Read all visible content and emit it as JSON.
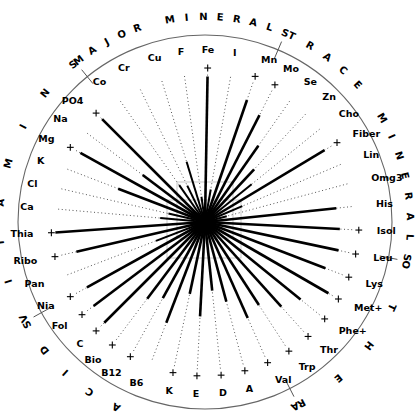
{
  "figure": {
    "center_x": 205,
    "center_y": 222,
    "outer_radius": 187,
    "axis_full_radius": 150
  },
  "groups": [
    {
      "name": "TRACE MINERALS",
      "text": "TRACE MINERALS",
      "start_deg": 295,
      "end_deg": 10
    },
    {
      "name": "OTHER",
      "text": "OTHER",
      "start_deg": 12,
      "end_deg": 62
    },
    {
      "name": "AMINO ACIDS",
      "text": "AMINO ACIDS",
      "start_deg": 64,
      "end_deg": 150
    },
    {
      "name": "VITAMINS",
      "text": "VITAMINS",
      "start_deg": 152,
      "end_deg": 230
    },
    {
      "name": "MAJOR MINERALS",
      "text": "MAJOR MINERALS",
      "start_deg": 232,
      "end_deg": 293
    }
  ],
  "chart_data": {
    "type": "radar",
    "xlabel": "",
    "ylabel": "",
    "grid": false,
    "legend_position": "none",
    "value_range": [
      0,
      1
    ],
    "sector_labels": [
      "TRACE MINERALS",
      "OTHER",
      "AMINO ACIDS",
      "VITAMINS",
      "MAJOR MINERALS"
    ],
    "categories": [
      "Co",
      "Cr",
      "Cu",
      "F",
      "Fe",
      "I",
      "Mn",
      "Mo",
      "Se",
      "Zn",
      "Cho",
      "Fiber",
      "Lin",
      "Omg3",
      "His",
      "Isol",
      "Leu",
      "Lys",
      "Met+",
      "Phe+",
      "Thr",
      "Trp",
      "Val",
      "A",
      "D",
      "E",
      "K",
      "B6",
      "B12",
      "Bio",
      "C",
      "Fol",
      "Nia",
      "Pan",
      "Ribo",
      "Thia",
      "Ca",
      "Cl",
      "K",
      "Mg",
      "Na",
      "PO4"
    ],
    "series": [
      {
        "name": "Nutrient amount",
        "values": [
          0.3,
          0.27,
          0.42,
          0.17,
          0.97,
          0.22,
          0.86,
          0.8,
          0.62,
          0.48,
          0.4,
          0.93,
          0.27,
          0.15,
          0.88,
          0.9,
          0.91,
          0.86,
          0.95,
          0.82,
          0.76,
          0.66,
          0.7,
          0.55,
          0.46,
          0.63,
          0.49,
          0.72,
          0.58,
          0.64,
          0.95,
          0.93,
          0.9,
          0.35,
          0.88,
          1.0,
          0.3,
          0.25,
          0.62,
          0.95,
          0.52,
          0.97
        ]
      }
    ],
    "markers": {
      "name": "Reference level (plus marks)",
      "categories_with_marker": [
        "Fe",
        "Mn",
        "Mo",
        "PO4",
        "Mg",
        "Fiber",
        "Thia",
        "Ribo",
        "Nia",
        "Fol",
        "C",
        "Isol",
        "Leu",
        "Lys",
        "Met+",
        "Phe+",
        "Thr",
        "Trp",
        "Val",
        "A",
        "D",
        "E",
        "K",
        "B12",
        "Bio"
      ]
    }
  },
  "nutrients": [
    {
      "label": "Ca",
      "angle": 185,
      "value": 0.3,
      "marker": false,
      "group": "MAJOR MINERALS"
    },
    {
      "label": "Cl",
      "angle": 193,
      "value": 0.25,
      "marker": false,
      "group": "MAJOR MINERALS"
    },
    {
      "label": "K",
      "angle": 201,
      "value": 0.62,
      "marker": false,
      "group": "MAJOR MINERALS"
    },
    {
      "label": "Mg",
      "angle": 209,
      "value": 0.95,
      "marker": true,
      "group": "MAJOR MINERALS"
    },
    {
      "label": "Na",
      "angle": 217,
      "value": 0.52,
      "marker": false,
      "group": "MAJOR MINERALS"
    },
    {
      "label": "PO4",
      "angle": 225,
      "value": 0.97,
      "marker": true,
      "group": "MAJOR MINERALS"
    },
    {
      "label": "Co",
      "angle": 235,
      "value": 0.3,
      "marker": false,
      "group": "TRACE MINERALS"
    },
    {
      "label": "Cr",
      "angle": 244,
      "value": 0.27,
      "marker": false,
      "group": "TRACE MINERALS"
    },
    {
      "label": "Cu",
      "angle": 253,
      "value": 0.42,
      "marker": false,
      "group": "TRACE MINERALS"
    },
    {
      "label": "F",
      "angle": 262,
      "value": 0.17,
      "marker": false,
      "group": "TRACE MINERALS"
    },
    {
      "label": "Fe",
      "angle": 271,
      "value": 0.97,
      "marker": true,
      "group": "TRACE MINERALS"
    },
    {
      "label": "I",
      "angle": 280,
      "value": 0.22,
      "marker": false,
      "group": "TRACE MINERALS"
    },
    {
      "label": "Mn",
      "angle": 289,
      "value": 0.86,
      "marker": true,
      "group": "TRACE MINERALS"
    },
    {
      "label": "Mo",
      "angle": 297,
      "value": 0.8,
      "marker": true,
      "group": "TRACE MINERALS"
    },
    {
      "label": "Se",
      "angle": 305,
      "value": 0.62,
      "marker": false,
      "group": "TRACE MINERALS"
    },
    {
      "label": "Zn",
      "angle": 313,
      "value": 0.48,
      "marker": false,
      "group": "OTHER"
    },
    {
      "label": "Cho",
      "angle": 321,
      "value": 0.4,
      "marker": false,
      "group": "OTHER"
    },
    {
      "label": "Fiber",
      "angle": 329,
      "value": 0.93,
      "marker": true,
      "group": "OTHER"
    },
    {
      "label": "Lin",
      "angle": 337,
      "value": 0.27,
      "marker": false,
      "group": "OTHER"
    },
    {
      "label": "Omg3",
      "angle": 345,
      "value": 0.15,
      "marker": false,
      "group": "OTHER"
    },
    {
      "label": "His",
      "angle": 354,
      "value": 0.88,
      "marker": false,
      "group": "AMINO ACIDS"
    },
    {
      "label": "Isol",
      "angle": 3,
      "value": 0.9,
      "marker": true,
      "group": "AMINO ACIDS"
    },
    {
      "label": "Leu",
      "angle": 12,
      "value": 0.91,
      "marker": true,
      "group": "AMINO ACIDS"
    },
    {
      "label": "Lys",
      "angle": 21,
      "value": 0.86,
      "marker": true,
      "group": "AMINO ACIDS"
    },
    {
      "label": "Met+",
      "angle": 30,
      "value": 0.95,
      "marker": true,
      "group": "AMINO ACIDS"
    },
    {
      "label": "Phe+",
      "angle": 39,
      "value": 0.82,
      "marker": true,
      "group": "AMINO ACIDS"
    },
    {
      "label": "Thr",
      "angle": 48,
      "value": 0.76,
      "marker": true,
      "group": "AMINO ACIDS"
    },
    {
      "label": "Trp",
      "angle": 57,
      "value": 0.66,
      "marker": true,
      "group": "AMINO ACIDS"
    },
    {
      "label": "Val",
      "angle": 66,
      "value": 0.7,
      "marker": true,
      "group": "AMINO ACIDS"
    },
    {
      "label": "A",
      "angle": 75,
      "value": 0.55,
      "marker": true,
      "group": "VITAMINS"
    },
    {
      "label": "D",
      "angle": 84,
      "value": 0.46,
      "marker": true,
      "group": "VITAMINS"
    },
    {
      "label": "E",
      "angle": 93,
      "value": 0.63,
      "marker": true,
      "group": "VITAMINS"
    },
    {
      "label": "K",
      "angle": 102,
      "value": 0.49,
      "marker": true,
      "group": "VITAMINS"
    },
    {
      "label": "B6",
      "angle": 111,
      "value": 0.72,
      "marker": false,
      "group": "VITAMINS"
    },
    {
      "label": "B12",
      "angle": 119,
      "value": 0.58,
      "marker": true,
      "group": "VITAMINS"
    },
    {
      "label": "Bio",
      "angle": 127,
      "value": 0.64,
      "marker": true,
      "group": "VITAMINS"
    },
    {
      "label": "C",
      "angle": 135,
      "value": 0.95,
      "marker": true,
      "group": "VITAMINS"
    },
    {
      "label": "Fol",
      "angle": 143,
      "value": 0.93,
      "marker": true,
      "group": "VITAMINS"
    },
    {
      "label": "Nia",
      "angle": 151,
      "value": 0.9,
      "marker": true,
      "group": "VITAMINS"
    },
    {
      "label": "Pan",
      "angle": 159,
      "value": 0.35,
      "marker": false,
      "group": "VITAMINS"
    },
    {
      "label": "Ribo",
      "angle": 167,
      "value": 0.88,
      "marker": true,
      "group": "VITAMINS"
    },
    {
      "label": "Thia",
      "angle": 176,
      "value": 1.0,
      "marker": true,
      "group": "VITAMINS"
    }
  ],
  "sector_ticks": [
    11,
    63,
    151,
    231,
    293
  ],
  "colors": {
    "spoke": "#000000",
    "dotted_axis": "#555555",
    "outer_circle": "#666666",
    "background": "#ffffff",
    "reference_box": "#bbbbbb"
  }
}
